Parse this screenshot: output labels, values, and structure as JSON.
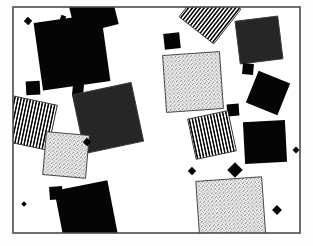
{
  "artwork": {
    "title": "Scattered Rotated Squares Composition",
    "canvas": {
      "width": 313,
      "height": 246
    },
    "background_color": "#fdfdfd",
    "frame": {
      "x": 13,
      "y": 7,
      "width": 287,
      "height": 226,
      "stroke_color": "#4a4a4a",
      "stroke_width": 1.6,
      "fill_color": "#ffffff"
    },
    "palette": {
      "solid_black": "#050505",
      "dark_texture": "#333333",
      "dark_texture_dot": "#0a0a0a",
      "light_stipple": "#d9d9d9",
      "light_stipple_dot": "#4a4a4a",
      "stripe_dark": "#0a0a0a",
      "stripe_light": "#ffffff",
      "shape_outline": "#3a3a3a",
      "page_background": "#fdfdfd"
    },
    "shape_count": 28,
    "shapes": [
      {
        "name": "black-square-top-edge-clipped",
        "fill": "solid",
        "cx": 92,
        "cy": 8,
        "size": 44,
        "rotation": -14
      },
      {
        "name": "black-square-large-upper-left",
        "fill": "solid",
        "cx": 72,
        "cy": 52,
        "size": 68,
        "rotation": -8
      },
      {
        "name": "black-diamond-tiny-upper-left",
        "fill": "solid",
        "cx": 28,
        "cy": 21,
        "size": 6,
        "rotation": 40
      },
      {
        "name": "black-square-small-left",
        "fill": "solid",
        "cx": 33,
        "cy": 88,
        "size": 14,
        "rotation": -3
      },
      {
        "name": "black-square-tiny-left-mid",
        "fill": "solid",
        "cx": 78,
        "cy": 90,
        "size": 11,
        "rotation": 6
      },
      {
        "name": "striped-square-left",
        "fill": "stripes",
        "cx": 30,
        "cy": 123,
        "size": 46,
        "rotation": 12
      },
      {
        "name": "dark-texture-square-center",
        "fill": "dark-texture",
        "cx": 108,
        "cy": 118,
        "size": 60,
        "rotation": -12
      },
      {
        "name": "light-stipple-square-left",
        "fill": "light-stipple",
        "cx": 66,
        "cy": 155,
        "size": 43,
        "rotation": 5
      },
      {
        "name": "black-diamond-tiny-center-left",
        "fill": "solid",
        "cx": 87,
        "cy": 142,
        "size": 6,
        "rotation": 42
      },
      {
        "name": "black-square-tiny-lower-left",
        "fill": "solid",
        "cx": 97,
        "cy": 187,
        "size": 7,
        "rotation": 8
      },
      {
        "name": "black-square-small-lower-left",
        "fill": "solid",
        "cx": 56,
        "cy": 193,
        "size": 13,
        "rotation": -4
      },
      {
        "name": "black-square-large-bottom-left",
        "fill": "solid",
        "cx": 86,
        "cy": 212,
        "size": 54,
        "rotation": -11
      },
      {
        "name": "black-square-small-upper-center",
        "fill": "solid",
        "cx": 172,
        "cy": 41,
        "size": 16,
        "rotation": -6
      },
      {
        "name": "striped-square-top-right-clipped",
        "fill": "stripes",
        "cx": 210,
        "cy": 13,
        "size": 44,
        "rotation": 38
      },
      {
        "name": "dark-texture-square-top-right",
        "fill": "dark-texture",
        "cx": 259,
        "cy": 40,
        "size": 43,
        "rotation": -7
      },
      {
        "name": "light-stipple-square-upper-right",
        "fill": "light-stipple",
        "cx": 193,
        "cy": 82,
        "size": 57,
        "rotation": -4
      },
      {
        "name": "black-square-tiny-right-upper",
        "fill": "solid",
        "cx": 248,
        "cy": 69,
        "size": 11,
        "rotation": 5
      },
      {
        "name": "black-square-right-mid",
        "fill": "solid",
        "cx": 268,
        "cy": 93,
        "size": 34,
        "rotation": 22
      },
      {
        "name": "black-square-tiny-right-center",
        "fill": "solid",
        "cx": 233,
        "cy": 110,
        "size": 12,
        "rotation": -4
      },
      {
        "name": "striped-square-right-center",
        "fill": "stripes",
        "cx": 212,
        "cy": 135,
        "size": 41,
        "rotation": -12
      },
      {
        "name": "black-square-right-lower",
        "fill": "solid",
        "cx": 265,
        "cy": 142,
        "size": 42,
        "rotation": -3
      },
      {
        "name": "black-diamond-small-center-bottom",
        "fill": "solid",
        "cx": 235,
        "cy": 170,
        "size": 11,
        "rotation": 45
      },
      {
        "name": "black-diamond-tiny-center-lower",
        "fill": "solid",
        "cx": 192,
        "cy": 171,
        "size": 6,
        "rotation": 44
      },
      {
        "name": "light-stipple-square-bottom-right",
        "fill": "light-stipple",
        "cx": 231,
        "cy": 212,
        "size": 66,
        "rotation": -4
      },
      {
        "name": "black-diamond-tiny-right-bottom",
        "fill": "solid",
        "cx": 277,
        "cy": 210,
        "size": 7,
        "rotation": 44
      },
      {
        "name": "black-diamond-tiny-top-right-edge",
        "fill": "solid",
        "cx": 296,
        "cy": 150,
        "size": 5,
        "rotation": 45
      },
      {
        "name": "black-square-tiny-top-center-left",
        "fill": "solid",
        "cx": 63,
        "cy": 18,
        "size": 5,
        "rotation": 20
      },
      {
        "name": "black-diamond-micro-left-low",
        "fill": "solid",
        "cx": 24,
        "cy": 204,
        "size": 4,
        "rotation": 45
      }
    ]
  }
}
